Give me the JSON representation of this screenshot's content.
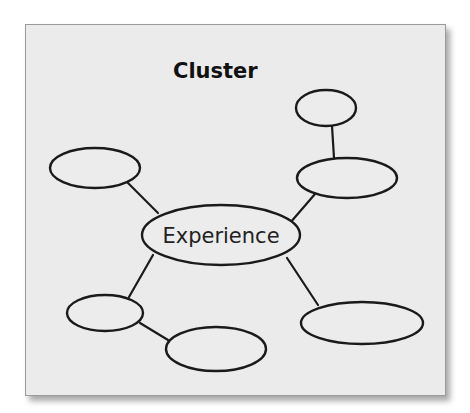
{
  "diagram": {
    "title": "Cluster",
    "center": {
      "label": "Experience",
      "cx": 221,
      "cy": 235,
      "rx": 79,
      "ry": 30
    },
    "nodes": [
      {
        "id": "top-right-small",
        "label": "",
        "cx": 326,
        "cy": 108,
        "rx": 30,
        "ry": 18
      },
      {
        "id": "right-middle",
        "label": "",
        "cx": 347,
        "cy": 178,
        "rx": 50,
        "ry": 20
      },
      {
        "id": "left-top",
        "label": "",
        "cx": 95,
        "cy": 168,
        "rx": 45,
        "ry": 20
      },
      {
        "id": "bottom-left",
        "label": "",
        "cx": 105,
        "cy": 313,
        "rx": 38,
        "ry": 18
      },
      {
        "id": "bottom-middle",
        "label": "",
        "cx": 216,
        "cy": 349,
        "rx": 50,
        "ry": 22
      },
      {
        "id": "bottom-right",
        "label": "",
        "cx": 362,
        "cy": 323,
        "rx": 61,
        "ry": 21
      }
    ],
    "edges": [
      {
        "from": "center",
        "to": "left-top",
        "x1": 158,
        "y1": 213,
        "x2": 128,
        "y2": 183
      },
      {
        "from": "center",
        "to": "right-middle",
        "x1": 290,
        "y1": 223,
        "x2": 315,
        "y2": 194
      },
      {
        "from": "right-middle",
        "to": "top-right-small",
        "x1": 334,
        "y1": 158,
        "x2": 332,
        "y2": 126
      },
      {
        "from": "center",
        "to": "bottom-left",
        "x1": 153,
        "y1": 255,
        "x2": 129,
        "y2": 297
      },
      {
        "from": "bottom-left",
        "to": "bottom-middle",
        "x1": 140,
        "y1": 323,
        "x2": 168,
        "y2": 340
      },
      {
        "from": "center",
        "to": "bottom-right",
        "x1": 287,
        "y1": 258,
        "x2": 318,
        "y2": 305
      }
    ],
    "colors": {
      "panel_bg": "#ebebeb",
      "stroke": "#1a1a1a",
      "text": "#222222"
    }
  }
}
